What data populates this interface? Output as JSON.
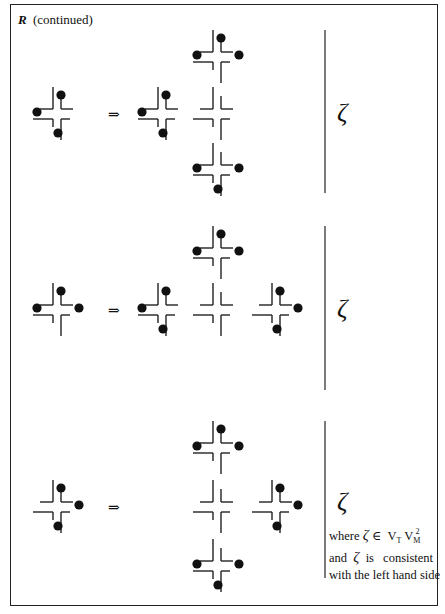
{
  "title": {
    "symbol": "R",
    "text": "(continued)"
  },
  "arrow_symbol": "⇒",
  "zeta_symbol": "ζ",
  "note": {
    "line1_prefix": "where",
    "line1_elem": "∈",
    "line1_set_base": "V",
    "line1_sub_T": "T",
    "line1_sub_M": "M",
    "line1_sup": "2",
    "line2_prefix": "and",
    "line2_suffix": "is   consistent",
    "line3": "with the left hand side"
  },
  "rules": [
    {
      "name": "rule-1",
      "lhs": {
        "center": [
          57,
          114
        ],
        "dots": [
          "top",
          "left",
          "bottom"
        ]
      },
      "rhs": [
        {
          "center": [
            162,
            114
          ],
          "dots": [
            "top",
            "left",
            "bottom"
          ]
        },
        {
          "center": [
            217,
            57
          ],
          "dots": [
            "top",
            "left",
            "right"
          ]
        },
        {
          "center": [
            217,
            114
          ],
          "dots": []
        },
        {
          "center": [
            217,
            170
          ],
          "dots": [
            "left",
            "right",
            "bottom"
          ]
        }
      ],
      "divider": [
        325,
        30,
        193
      ],
      "arrow_y": 106,
      "zeta_y": 98
    },
    {
      "name": "rule-2",
      "lhs": {
        "center": [
          57,
          310
        ],
        "dots": [
          "top",
          "left",
          "right"
        ]
      },
      "rhs": [
        {
          "center": [
            162,
            310
          ],
          "dots": [
            "top",
            "left",
            "bottom"
          ]
        },
        {
          "center": [
            217,
            253
          ],
          "dots": [
            "top",
            "left",
            "right"
          ]
        },
        {
          "center": [
            217,
            310
          ],
          "dots": []
        },
        {
          "center": [
            276,
            310
          ],
          "dots": [
            "top",
            "right",
            "bottom"
          ]
        }
      ],
      "divider": [
        325,
        226,
        390
      ],
      "arrow_y": 302,
      "zeta_y": 294
    },
    {
      "name": "rule-3",
      "lhs": {
        "center": [
          57,
          507
        ],
        "dots": [
          "top",
          "right",
          "bottom"
        ]
      },
      "rhs": [
        {
          "center": [
            217,
            448
          ],
          "dots": [
            "top",
            "left",
            "right"
          ]
        },
        {
          "center": [
            217,
            507
          ],
          "dots": []
        },
        {
          "center": [
            217,
            566
          ],
          "dots": [
            "left",
            "right",
            "bottom"
          ]
        },
        {
          "center": [
            276,
            507
          ],
          "dots": [
            "top",
            "right",
            "bottom"
          ]
        }
      ],
      "divider": [
        325,
        421,
        578
      ],
      "arrow_y": 499,
      "zeta_y": 490
    }
  ]
}
